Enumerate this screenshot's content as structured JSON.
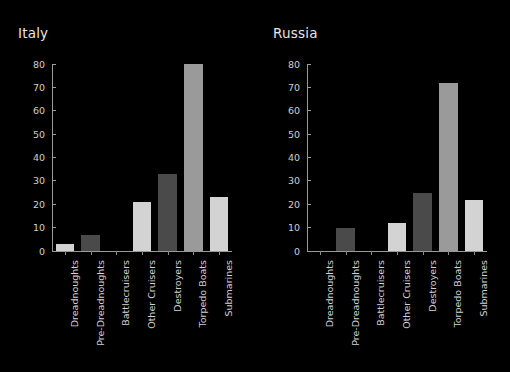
{
  "figure": {
    "background_color": "#000000",
    "text_color": "#d8d8d8",
    "axis_color": "#9a9a9a"
  },
  "panels": [
    {
      "title": "Italy"
    },
    {
      "title": "Russia"
    }
  ],
  "axis": {
    "yticks": [
      "0",
      "10",
      "20",
      "30",
      "40",
      "50",
      "60",
      "70",
      "80"
    ],
    "ymin": 0,
    "ymax": 80
  },
  "chart_data": [
    {
      "type": "bar",
      "title": "Italy",
      "categories": [
        "Dreadnoughts",
        "Pre-Dreadnoughts",
        "Battlecruisers",
        "Other Cruisers",
        "Destroyers",
        "Torpedo Boats",
        "Submarines"
      ],
      "values": [
        3,
        7,
        0,
        21,
        33,
        80,
        23
      ],
      "colors": [
        "#d3d3d3",
        "#4a4a4a",
        "#9a9a9a",
        "#d3d3d3",
        "#4a4a4a",
        "#9a9a9a",
        "#d3d3d3"
      ],
      "xlabel": "",
      "ylabel": "",
      "ylim": [
        0,
        80
      ],
      "yticks": [
        0,
        10,
        20,
        30,
        40,
        50,
        60,
        70,
        80
      ],
      "grid": false,
      "legend": "none"
    },
    {
      "type": "bar",
      "title": "Russia",
      "categories": [
        "Dreadnoughts",
        "Pre-Dreadnoughts",
        "Battlecruisers",
        "Other Cruisers",
        "Destroyers",
        "Torpedo Boats",
        "Submarines"
      ],
      "values": [
        0,
        10,
        0,
        12,
        25,
        72,
        22
      ],
      "colors": [
        "#d3d3d3",
        "#4a4a4a",
        "#9a9a9a",
        "#d3d3d3",
        "#4a4a4a",
        "#9a9a9a",
        "#d3d3d3"
      ],
      "xlabel": "",
      "ylabel": "",
      "ylim": [
        0,
        80
      ],
      "yticks": [
        0,
        10,
        20,
        30,
        40,
        50,
        60,
        70,
        80
      ],
      "grid": false,
      "legend": "none"
    }
  ]
}
